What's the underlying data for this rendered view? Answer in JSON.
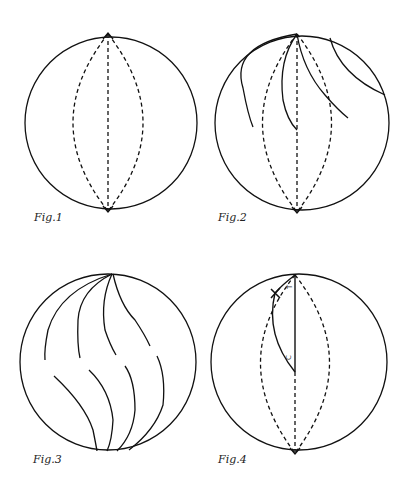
{
  "figures": [
    {
      "id": "fig1",
      "label": "Fig.1",
      "description": "Sphere with three dashed meridians (one straight axis, two curved) connecting the poles"
    },
    {
      "id": "fig2",
      "label": "Fig.2",
      "description": "Sphere with dashed meridians and solid curved lines radiating from the top pole"
    },
    {
      "id": "fig3",
      "label": "Fig.3",
      "description": "Sphere with solid curved S-shaped lines from top and bottom poles"
    },
    {
      "id": "fig4",
      "label": "Fig.4",
      "description": "Sphere with dashed meridians, solid axis from top pole to center, curved arc with cross mark, labels T and C"
    }
  ],
  "annotations": {
    "fig4_top_label": "T",
    "fig4_center_label": "C"
  },
  "colors": {
    "stroke": "#111111",
    "background": "#ffffff"
  }
}
